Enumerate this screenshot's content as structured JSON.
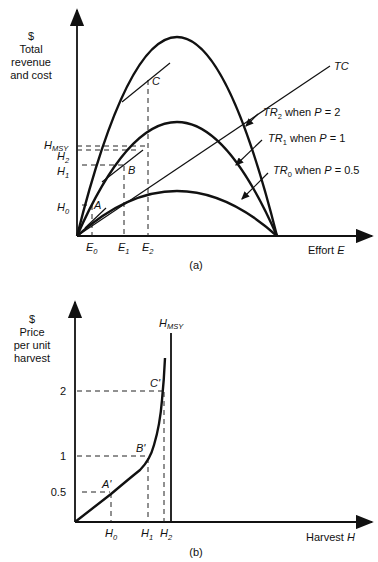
{
  "panel_a": {
    "y_axis_label": [
      "$",
      "Total",
      "revenue",
      "and cost"
    ],
    "x_axis_label": "Effort",
    "x_axis_var": "E",
    "caption": "(a)",
    "y_ticks": [
      {
        "base": "H",
        "sub": "MSY"
      },
      {
        "base": "H",
        "sub": "2"
      },
      {
        "base": "H",
        "sub": "1"
      },
      {
        "base": "H",
        "sub": "0"
      }
    ],
    "x_ticks": [
      {
        "base": "E",
        "sub": "0"
      },
      {
        "base": "E",
        "sub": "1"
      },
      {
        "base": "E",
        "sub": "2"
      }
    ],
    "points": [
      "A",
      "B",
      "C"
    ],
    "tc_label": "TC",
    "curves": [
      {
        "base": "TR",
        "sub": "2",
        "text": " when ",
        "var": "P",
        "eq": " = 2"
      },
      {
        "base": "TR",
        "sub": "1",
        "text": " when ",
        "var": "P",
        "eq": " = 1"
      },
      {
        "base": "TR",
        "sub": "0",
        "text": " when ",
        "var": "P",
        "eq": " = 0.5"
      }
    ]
  },
  "panel_b": {
    "y_axis_label": [
      "$",
      "Price",
      "per unit",
      "harvest"
    ],
    "x_axis_label": "Harvest",
    "x_axis_var": "H",
    "caption": "(b)",
    "vertical_line": {
      "base": "H",
      "sub": "MSY"
    },
    "y_ticks": [
      "2",
      "1",
      "0.5"
    ],
    "x_ticks": [
      {
        "base": "H",
        "sub": "0"
      },
      {
        "base": "H",
        "sub": "1"
      },
      {
        "base": "H",
        "sub": "2"
      }
    ],
    "points": [
      "A'",
      "B'",
      "C'"
    ]
  }
}
